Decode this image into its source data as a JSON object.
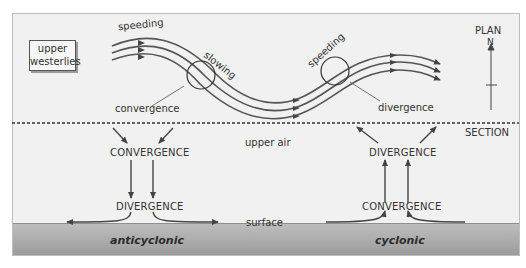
{
  "header": {
    "partial_text": "upper westerlies"
  },
  "plan": {
    "title": "PLAN",
    "north_label": "N",
    "box_label_line1": "upper",
    "box_label_line2": "westerlies",
    "speeding_left": "speeding",
    "slowing": "slowing",
    "speeding_right": "speeding",
    "convergence": "convergence",
    "divergence": "divergence"
  },
  "section": {
    "title": "SECTION",
    "upper_air": "upper air",
    "surface": "surface",
    "anticyclonic": {
      "label": "anticyclonic",
      "top": "CONVERGENCE",
      "bottom": "DIVERGENCE"
    },
    "cyclonic": {
      "label": "cyclonic",
      "top": "DIVERGENCE",
      "bottom": "CONVERGENCE"
    }
  },
  "colors": {
    "background": "#f1f1f1",
    "ground": "#a8a8a8",
    "line": "#444444"
  }
}
